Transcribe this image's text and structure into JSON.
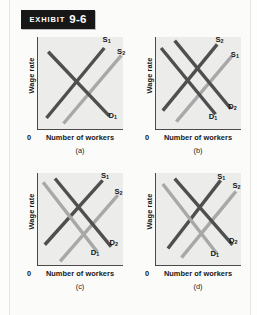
{
  "exhibit": {
    "word": "Exhibit",
    "number": "9-6"
  },
  "axes": {
    "y_label": "Wage rate",
    "x_label": "Number of workers",
    "origin": "0"
  },
  "colors": {
    "dark_curve": "#4f4f4f",
    "light_curve": "#a8a8a8",
    "plot_background": "#ececeb",
    "axis": "#4a4a4a",
    "badge_background": "#171717",
    "page_background": "#fdfdfc"
  },
  "chart_data": {
    "type": "line",
    "title": "Exhibit 9-6",
    "xlabel": "Number of workers",
    "ylabel": "Wage rate",
    "xlim": [
      0,
      100
    ],
    "ylim": [
      0,
      100
    ],
    "grid": false,
    "legend": "none",
    "note": "Four supply-and-demand panels for a labor market; supply curves slope up, demand curves slope down. Coordinates are percentages of the plot box (x from left, y from bottom).",
    "panels": [
      {
        "id": "a",
        "caption": "(a)",
        "curves": [
          {
            "name": "S1",
            "label": "S",
            "sub": "1",
            "kind": "supply",
            "shade": "dark",
            "x1": 10,
            "y1": 12,
            "x2": 78,
            "y2": 88,
            "label_x": 76,
            "label_y": 93
          },
          {
            "name": "S2",
            "label": "S",
            "sub": "2",
            "kind": "supply",
            "shade": "light",
            "x1": 30,
            "y1": 6,
            "x2": 98,
            "y2": 80,
            "label_x": 93,
            "label_y": 80
          },
          {
            "name": "D1",
            "label": "D",
            "sub": "1",
            "kind": "demand",
            "shade": "dark",
            "x1": 12,
            "y1": 84,
            "x2": 84,
            "y2": 14,
            "label_x": 83,
            "label_y": 10
          }
        ]
      },
      {
        "id": "b",
        "caption": "(b)",
        "curves": [
          {
            "name": "S2",
            "label": "S",
            "sub": "2",
            "kind": "supply",
            "shade": "dark",
            "x1": 8,
            "y1": 20,
            "x2": 72,
            "y2": 92,
            "label_x": 70,
            "label_y": 93
          },
          {
            "name": "S1",
            "label": "S",
            "sub": "1",
            "kind": "supply",
            "shade": "light",
            "x1": 24,
            "y1": 8,
            "x2": 90,
            "y2": 80,
            "label_x": 88,
            "label_y": 77
          },
          {
            "name": "D1",
            "label": "D",
            "sub": "1",
            "kind": "demand",
            "shade": "dark",
            "x1": 6,
            "y1": 88,
            "x2": 70,
            "y2": 16,
            "label_x": 62,
            "label_y": 9
          },
          {
            "name": "D2",
            "label": "D",
            "sub": "2",
            "kind": "demand",
            "shade": "dark",
            "x1": 22,
            "y1": 96,
            "x2": 88,
            "y2": 22,
            "label_x": 85,
            "label_y": 20
          }
        ]
      },
      {
        "id": "c",
        "caption": "(c)",
        "curves": [
          {
            "name": "S1",
            "label": "S",
            "sub": "1",
            "kind": "supply",
            "shade": "dark",
            "x1": 8,
            "y1": 22,
            "x2": 76,
            "y2": 92,
            "label_x": 74,
            "label_y": 93
          },
          {
            "name": "S2",
            "label": "S",
            "sub": "2",
            "kind": "supply",
            "shade": "light",
            "x1": 26,
            "y1": 4,
            "x2": 94,
            "y2": 76,
            "label_x": 90,
            "label_y": 76
          },
          {
            "name": "D1",
            "label": "D",
            "sub": "1",
            "kind": "demand",
            "shade": "light",
            "x1": 6,
            "y1": 90,
            "x2": 70,
            "y2": 14,
            "label_x": 62,
            "label_y": 9
          },
          {
            "name": "D2",
            "label": "D",
            "sub": "2",
            "kind": "demand",
            "shade": "dark",
            "x1": 20,
            "y1": 94,
            "x2": 86,
            "y2": 20,
            "label_x": 84,
            "label_y": 20
          }
        ]
      },
      {
        "id": "d",
        "caption": "(d)",
        "curves": [
          {
            "name": "S1",
            "label": "S",
            "sub": "1",
            "kind": "supply",
            "shade": "dark",
            "x1": 14,
            "y1": 18,
            "x2": 76,
            "y2": 92,
            "label_x": 72,
            "label_y": 92
          },
          {
            "name": "S2",
            "label": "S",
            "sub": "2",
            "kind": "supply",
            "shade": "light",
            "x1": 30,
            "y1": 8,
            "x2": 94,
            "y2": 80,
            "label_x": 90,
            "label_y": 82
          },
          {
            "name": "D1",
            "label": "D",
            "sub": "1",
            "kind": "demand",
            "shade": "light",
            "x1": 8,
            "y1": 88,
            "x2": 72,
            "y2": 12,
            "label_x": 64,
            "label_y": 8
          },
          {
            "name": "D2",
            "label": "D",
            "sub": "2",
            "kind": "demand",
            "shade": "dark",
            "x1": 22,
            "y1": 94,
            "x2": 90,
            "y2": 22,
            "label_x": 86,
            "label_y": 22
          }
        ]
      }
    ]
  }
}
